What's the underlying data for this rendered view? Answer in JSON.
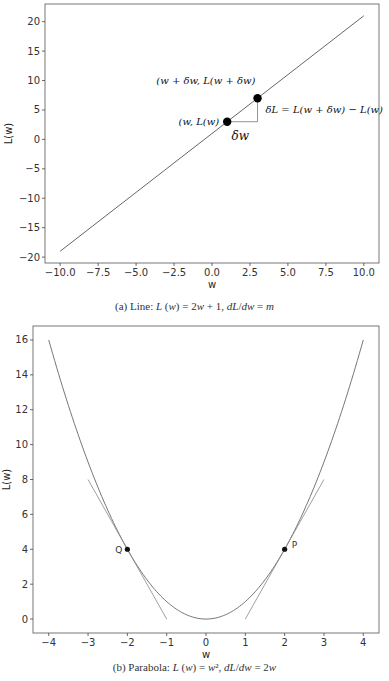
{
  "chart_data": [
    {
      "type": "line",
      "title": "",
      "caption": "(a) Line: L (w) = 2w + 1, dL/dw = m",
      "xlabel": "w",
      "ylabel": "L(w)",
      "xlim": [
        -11,
        11
      ],
      "ylim": [
        -21,
        23
      ],
      "xticks": [
        "−10.0",
        "−7.5",
        "−5.0",
        "−2.5",
        "0.0",
        "2.5",
        "5.0",
        "7.5",
        "10.0"
      ],
      "yticks": [
        "−20",
        "−15",
        "−10",
        "−5",
        "0",
        "5",
        "10",
        "15",
        "20"
      ],
      "grid": false,
      "series": [
        {
          "name": "L(w) = 2w + 1",
          "x": [
            -10,
            10
          ],
          "y": [
            -19,
            21
          ]
        }
      ],
      "points": [
        {
          "x": 1,
          "y": 3,
          "label": "(w, L(w)"
        },
        {
          "x": 3,
          "y": 7,
          "label": "(w + δw, L(w + δw)"
        }
      ],
      "annotations": [
        "δw",
        "δL = L(w + δw) − L(w)"
      ]
    },
    {
      "type": "line",
      "title": "",
      "caption": "(b) Parabola: L (w) = w², dL/dw = 2w",
      "xlabel": "w",
      "ylabel": "L(w)",
      "xlim": [
        -4.4,
        4.4
      ],
      "ylim": [
        -0.8,
        16.8
      ],
      "xticks": [
        "−4",
        "−3",
        "−2",
        "−1",
        "0",
        "1",
        "2",
        "3",
        "4"
      ],
      "yticks": [
        "0",
        "2",
        "4",
        "6",
        "8",
        "10",
        "12",
        "14",
        "16"
      ],
      "grid": false,
      "series": [
        {
          "name": "L(w) = w^2",
          "x": [
            -4,
            -3,
            -2,
            -1,
            0,
            1,
            2,
            3,
            4
          ],
          "y": [
            16,
            9,
            4,
            1,
            0,
            1,
            4,
            9,
            16
          ]
        },
        {
          "name": "tangent at Q",
          "x": [
            -3,
            -1
          ],
          "y": [
            8,
            0
          ]
        },
        {
          "name": "tangent at P",
          "x": [
            1,
            3
          ],
          "y": [
            0,
            8
          ]
        }
      ],
      "points": [
        {
          "x": -2,
          "y": 4,
          "label": "Q"
        },
        {
          "x": 2,
          "y": 4,
          "label": "P"
        }
      ]
    }
  ],
  "captions": {
    "a_prefix": "(a) Line: ",
    "b_prefix": "(b) Parabola: "
  }
}
